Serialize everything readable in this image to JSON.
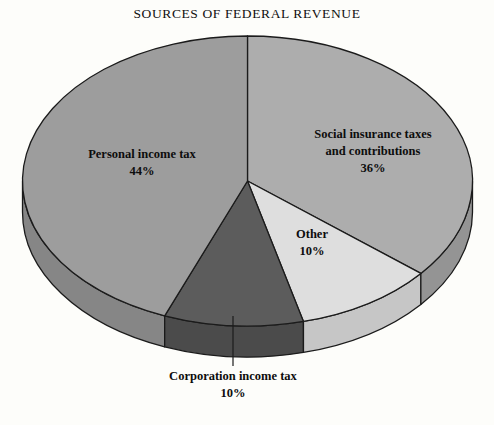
{
  "chart_data": {
    "type": "pie",
    "title": "SOURCES OF FEDERAL REVENUE",
    "xlabel": "",
    "ylabel": "",
    "legend_position": "none",
    "grid": false,
    "three_d": true,
    "categories": [
      "Personal income tax",
      "Social insurance taxes and contributions",
      "Other",
      "Corporation income tax"
    ],
    "values": [
      44,
      36,
      10,
      10
    ],
    "value_labels": [
      "44%",
      "36%",
      "10%",
      "10%"
    ],
    "slices": [
      {
        "name": "Personal income tax",
        "label_line1": "Personal income tax",
        "label_line2": "",
        "percent_text": "44%",
        "value": 44,
        "color": "#9d9d9d",
        "side_color": "#868686"
      },
      {
        "name": "Social insurance taxes and contributions",
        "label_line1": "Social insurance taxes",
        "label_line2": "and contributions",
        "percent_text": "36%",
        "value": 36,
        "color": "#adadad",
        "side_color": "#949494"
      },
      {
        "name": "Other",
        "label_line1": "Other",
        "label_line2": "",
        "percent_text": "10%",
        "value": 10,
        "color": "#dedede",
        "side_color": "#c6c6c6"
      },
      {
        "name": "Corporation income tax",
        "label_line1": "Corporation income tax",
        "label_line2": "",
        "percent_text": "10%",
        "value": 10,
        "color": "#5c5c5c",
        "side_color": "#4b4b4b"
      }
    ],
    "colors": {
      "outline": "#1b1b1b",
      "background": "#fdfdfa",
      "text": "#0d0d0d"
    }
  }
}
